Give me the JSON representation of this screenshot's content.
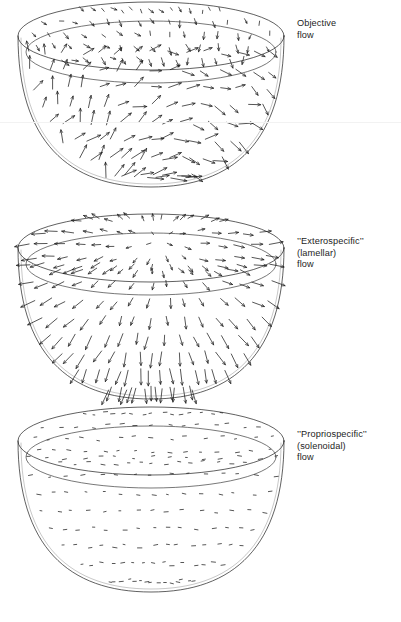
{
  "figure": {
    "background_color": "#ffffff",
    "ink_color": "#1d1d1d",
    "panels": [
      {
        "id": "objective",
        "label_lines": [
          "Objective",
          "flow"
        ],
        "label_x": 297,
        "label_y": 18,
        "bowl": {
          "cx": 151,
          "rim_cy": 52,
          "rx": 133,
          "ry": 34,
          "rim_band": 16,
          "depth": 151,
          "top": 16,
          "field_kind": "objective",
          "arrow_count": 170
        }
      },
      {
        "id": "exterospecific",
        "label_lines": [
          "’’Exterospecific’’",
          "(lamellar)",
          "flow"
        ],
        "label_x": 297,
        "label_y": 236,
        "bowl": {
          "cx": 151,
          "rim_cy": 254,
          "rx": 133,
          "ry": 34,
          "rim_band": 16,
          "depth": 151,
          "top": 218,
          "field_kind": "lamellar",
          "arrow_count": 170
        }
      },
      {
        "id": "propriospecific",
        "label_lines": [
          "’’Propriospecific’’",
          "(solenoidal)",
          "flow"
        ],
        "label_x": 297,
        "label_y": 429,
        "bowl": {
          "cx": 151,
          "rim_cy": 447,
          "rx": 133,
          "ry": 34,
          "rim_band": 16,
          "depth": 151,
          "top": 411,
          "field_kind": "solenoidal",
          "arrow_count": 170
        }
      }
    ],
    "scanlines": [
      122
    ]
  },
  "chart_data": {
    "type": "scatter",
    "xlabel": "",
    "ylabel": "",
    "legend_position": "right",
    "series": [
      {
        "name": "Objective flow",
        "annotation": "Objective flow",
        "description": "Full optic-flow vector field sampled over the inside of a hemisphere; vectors vary in length and direction, longest near the lower rim.",
        "vector_count": 170,
        "mean_vector_length_px": 7.5,
        "pattern": "mixed translational-plus-rotational flow"
      },
      {
        "name": "Exterospecific (lamellar) flow",
        "annotation": "’’Exterospecific’’ (lamellar) flow",
        "description": "Lamellar component radiating from a focus of expansion; vectors align along meridians and lengthen away from the pole.",
        "vector_count": 170,
        "mean_vector_length_px": 8.0,
        "pattern": "radial / lamellar (curl-free)"
      },
      {
        "name": "Propriospecific (solenoidal) flow",
        "annotation": "’’Propriospecific’’ (solenoidal) flow",
        "description": "Solenoidal component; short, nearly uniform horizontal vectors forming closed circulation with no divergence.",
        "vector_count": 170,
        "mean_vector_length_px": 3.2,
        "pattern": "circulatory / solenoidal (divergence-free)"
      }
    ]
  }
}
